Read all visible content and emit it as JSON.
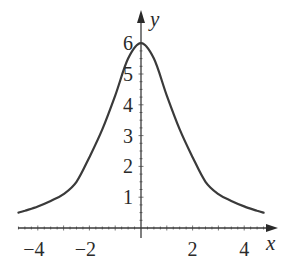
{
  "chart_data": {
    "type": "line",
    "title": "",
    "xlabel": "x",
    "ylabel": "y",
    "xlim": [
      -4.8,
      4.8
    ],
    "ylim": [
      0,
      6.3
    ],
    "grid": false,
    "legend": null,
    "x_ticks": [
      -4,
      -2,
      2,
      4
    ],
    "x_tick_labels": [
      "−4",
      "−2",
      "2",
      "4"
    ],
    "y_ticks": [
      1,
      2,
      3,
      4,
      5,
      6
    ],
    "y_tick_labels": [
      "1",
      "2",
      "3",
      "4",
      "5",
      "6"
    ],
    "minor_ticks_per_unit": 4,
    "series": [
      {
        "name": "f(x)",
        "x": [
          -4.75,
          -4.5,
          -4,
          -3.5,
          -3,
          -2.5,
          -2,
          -1.5,
          -1,
          -0.5,
          0,
          0.5,
          1,
          1.5,
          2,
          2.5,
          3,
          3.5,
          4,
          4.5,
          4.75
        ],
        "values": [
          0.5,
          0.56,
          0.7,
          0.88,
          1.1,
          1.5,
          2.3,
          3.2,
          4.3,
          5.5,
          6.0,
          5.5,
          4.3,
          3.2,
          2.3,
          1.5,
          1.1,
          0.88,
          0.7,
          0.56,
          0.5
        ]
      }
    ],
    "color": "#3a3a3a"
  }
}
